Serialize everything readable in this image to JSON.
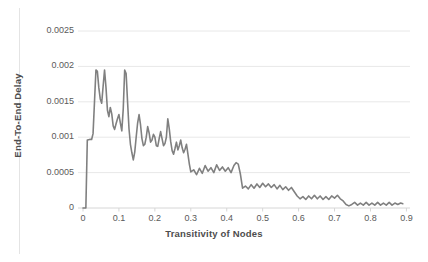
{
  "chart_data": {
    "type": "line",
    "title": "",
    "xlabel": "Transitivity of Nodes",
    "ylabel": "End-To-End Delay",
    "xlim": [
      0,
      0.91
    ],
    "ylim": [
      0,
      0.0025
    ],
    "grid": "horizontal",
    "legend": "none",
    "line_color": "#808080",
    "xticks": [
      "0",
      "0.1",
      "0.2",
      "0.3",
      "0.4",
      "0.5",
      "0.6",
      "0.7",
      "0.8",
      "0.9"
    ],
    "xtick_values": [
      0,
      0.1,
      0.2,
      0.3,
      0.4,
      0.5,
      0.6,
      0.7,
      0.8,
      0.9
    ],
    "yticks": [
      "0",
      "0.0005",
      "0.001",
      "0.0015",
      "0.002",
      "0.0025"
    ],
    "ytick_values": [
      0,
      0.0005,
      0.001,
      0.0015,
      0.002,
      0.0025
    ],
    "series": [
      {
        "name": "End-To-End Delay",
        "x": [
          0.0,
          0.004,
          0.008,
          0.012,
          0.016,
          0.02,
          0.024,
          0.028,
          0.032,
          0.036,
          0.04,
          0.044,
          0.048,
          0.052,
          0.056,
          0.06,
          0.064,
          0.068,
          0.072,
          0.076,
          0.08,
          0.084,
          0.088,
          0.092,
          0.096,
          0.1,
          0.104,
          0.108,
          0.112,
          0.116,
          0.12,
          0.124,
          0.128,
          0.132,
          0.136,
          0.14,
          0.144,
          0.148,
          0.152,
          0.156,
          0.16,
          0.164,
          0.168,
          0.172,
          0.176,
          0.18,
          0.184,
          0.188,
          0.192,
          0.196,
          0.2,
          0.204,
          0.208,
          0.212,
          0.216,
          0.22,
          0.224,
          0.228,
          0.232,
          0.236,
          0.24,
          0.244,
          0.248,
          0.252,
          0.256,
          0.26,
          0.264,
          0.268,
          0.272,
          0.276,
          0.28,
          0.284,
          0.288,
          0.292,
          0.296,
          0.3,
          0.308,
          0.316,
          0.324,
          0.332,
          0.34,
          0.348,
          0.356,
          0.364,
          0.372,
          0.38,
          0.388,
          0.396,
          0.404,
          0.412,
          0.42,
          0.426,
          0.432,
          0.438,
          0.444,
          0.452,
          0.46,
          0.468,
          0.476,
          0.484,
          0.492,
          0.5,
          0.508,
          0.516,
          0.524,
          0.532,
          0.54,
          0.548,
          0.556,
          0.564,
          0.572,
          0.58,
          0.588,
          0.596,
          0.604,
          0.612,
          0.62,
          0.628,
          0.636,
          0.644,
          0.652,
          0.66,
          0.668,
          0.676,
          0.684,
          0.692,
          0.7,
          0.708,
          0.716,
          0.724,
          0.732,
          0.74,
          0.748,
          0.756,
          0.764,
          0.772,
          0.78,
          0.788,
          0.796,
          0.804,
          0.812,
          0.82,
          0.828,
          0.836,
          0.844,
          0.852,
          0.86,
          0.868,
          0.876,
          0.884,
          0.89
        ],
        "y": [
          0.0,
          0.0,
          0.0,
          0.00096,
          0.000965,
          0.00097,
          0.000968,
          0.00105,
          0.0015,
          0.00195,
          0.00193,
          0.0017,
          0.00154,
          0.00148,
          0.00172,
          0.00195,
          0.0017,
          0.00138,
          0.00129,
          0.00142,
          0.00133,
          0.00116,
          0.00111,
          0.00119,
          0.00126,
          0.00132,
          0.0012,
          0.00109,
          0.0014,
          0.00195,
          0.0019,
          0.0015,
          0.00112,
          0.0009,
          0.00078,
          0.00068,
          0.00079,
          0.001,
          0.0012,
          0.00132,
          0.00118,
          0.00098,
          0.00088,
          0.0009,
          0.001,
          0.00115,
          0.00106,
          0.00093,
          0.00096,
          0.00104,
          0.001,
          0.00088,
          0.00087,
          0.00098,
          0.00108,
          0.00098,
          0.00088,
          0.00091,
          0.001,
          0.00126,
          0.00112,
          0.00094,
          0.00081,
          0.00076,
          0.00084,
          0.00093,
          0.00082,
          0.00088,
          0.00096,
          0.00085,
          0.00078,
          0.00083,
          0.0009,
          0.00076,
          0.00062,
          0.00051,
          0.00054,
          0.00047,
          0.00056,
          0.00049,
          0.0006,
          0.00052,
          0.00057,
          0.0005,
          0.00061,
          0.00053,
          0.00058,
          0.00052,
          0.00057,
          0.0005,
          0.0006,
          0.00064,
          0.00062,
          0.00048,
          0.00028,
          0.00031,
          0.00027,
          0.00033,
          0.00028,
          0.00034,
          0.00029,
          0.00035,
          0.0003,
          0.00034,
          0.00029,
          0.00033,
          0.00027,
          0.00032,
          0.00026,
          0.0003,
          0.00025,
          0.00029,
          0.00023,
          0.00017,
          0.00013,
          0.00016,
          0.00012,
          0.00017,
          0.00013,
          0.00018,
          0.00013,
          0.00017,
          0.00012,
          0.00016,
          0.00012,
          0.00017,
          0.00014,
          0.00018,
          0.00013,
          0.0001,
          5e-05,
          3e-05,
          5e-05,
          8e-05,
          4e-05,
          7e-05,
          4e-05,
          8e-05,
          4e-05,
          7e-05,
          4e-05,
          8e-05,
          4e-05,
          7e-05,
          4e-05,
          8e-05,
          4e-05,
          7e-05,
          5e-05,
          7e-05,
          6e-05
        ]
      }
    ]
  }
}
